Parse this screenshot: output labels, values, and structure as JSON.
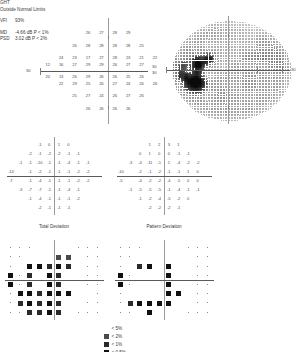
{
  "report": {
    "type": "humphrey-visual-field-single-field-analysis"
  },
  "sensitivity_plot": {
    "name": "numeric-sensitivity-grid",
    "axis_label_left": "30",
    "rows": [
      {
        "y": 3,
        "values": [
          null,
          null,
          null,
          26,
          27,
          28,
          29,
          null,
          null,
          null
        ]
      },
      {
        "y": 2,
        "values": [
          null,
          null,
          26,
          28,
          28,
          28,
          28,
          25,
          null,
          null
        ]
      },
      {
        "y": 1,
        "values": [
          null,
          24,
          23,
          17,
          27,
          28,
          23,
          21,
          22,
          null
        ]
      },
      {
        "y": 0.5,
        "values": [
          12,
          16,
          27,
          29,
          29,
          26,
          27,
          27,
          null,
          null
        ]
      },
      {
        "y": -0.5,
        "values": [
          20,
          13,
          26,
          29,
          26,
          26,
          25,
          26,
          null,
          null
        ]
      },
      {
        "y": -1,
        "values": [
          null,
          22,
          29,
          25,
          26,
          27,
          24,
          26,
          26,
          null
        ]
      },
      {
        "y": -2,
        "values": [
          null,
          null,
          25,
          27,
          24,
          26,
          27,
          26,
          null,
          null
        ]
      },
      {
        "y": -3,
        "values": [
          null,
          null,
          null,
          26,
          26,
          26,
          26,
          null,
          null,
          null
        ]
      }
    ]
  },
  "grayscale_plot": {
    "name": "grayscale-sensitivity-map",
    "label_left_top": "30",
    "label_left_bottom": "30",
    "label_right": "30"
  },
  "total_deviation_numeric": {
    "name": "total-deviation-numeric-grid",
    "caption": "Total Deviation",
    "rows": [
      {
        "values": [
          null,
          null,
          null,
          -1,
          0,
          1,
          0,
          null,
          null,
          null
        ]
      },
      {
        "values": [
          null,
          null,
          -2,
          -1,
          -2,
          -2,
          -1,
          -1,
          null,
          null
        ]
      },
      {
        "values": [
          null,
          -1,
          -1,
          -10,
          -1,
          -1,
          -4,
          -1,
          -1,
          null
        ]
      },
      {
        "values": [
          -14,
          null,
          -1,
          -2,
          -1,
          -1,
          -1,
          -2,
          -2,
          null
        ]
      },
      {
        "values": [
          -7,
          null,
          -1,
          -4,
          -1,
          -1,
          -1,
          -2,
          -2,
          null
        ]
      },
      {
        "values": [
          null,
          -3,
          -7,
          -7,
          -1,
          -1,
          -4,
          -1,
          null,
          null
        ]
      },
      {
        "values": [
          null,
          null,
          -1,
          -4,
          -1,
          -1,
          -1,
          -2,
          null,
          null
        ]
      },
      {
        "values": [
          null,
          null,
          null,
          -2,
          -1,
          -1,
          -1,
          null,
          null,
          null
        ]
      }
    ]
  },
  "pattern_deviation_numeric": {
    "name": "pattern-deviation-numeric-grid",
    "caption": "Pattern Deviation",
    "rows": [
      {
        "values": [
          null,
          null,
          null,
          1,
          2,
          3,
          1,
          null,
          null,
          null
        ]
      },
      {
        "values": [
          null,
          null,
          0,
          1,
          0,
          0,
          -1,
          -1,
          null,
          null
        ]
      },
      {
        "values": [
          null,
          -3,
          -4,
          -11,
          -1,
          1,
          -4,
          -2,
          -2,
          null
        ]
      },
      {
        "values": [
          -10,
          null,
          -2,
          -1,
          -2,
          -1,
          -1,
          1,
          0,
          null
        ]
      },
      {
        "values": [
          -5,
          null,
          -4,
          -2,
          -2,
          -4,
          -5,
          0,
          0,
          null
        ]
      },
      {
        "values": [
          null,
          -1,
          -5,
          -5,
          -5,
          -1,
          -4,
          -1,
          -1,
          null
        ]
      },
      {
        "values": [
          null,
          null,
          -1,
          -2,
          -4,
          -5,
          -2,
          0,
          null,
          null
        ]
      },
      {
        "values": [
          null,
          null,
          null,
          -2,
          -2,
          -2,
          -1,
          null,
          null,
          null
        ]
      }
    ]
  },
  "total_deviation_prob": {
    "name": "total-deviation-probability-plot",
    "rows": [
      {
        "levels": [
          0,
          0,
          0,
          1,
          1,
          1,
          1,
          0,
          0,
          0
        ]
      },
      {
        "levels": [
          0,
          0,
          1,
          1,
          1,
          2,
          2,
          1,
          0,
          0
        ]
      },
      {
        "levels": [
          0,
          1,
          4,
          4,
          3,
          4,
          3,
          1,
          0,
          0
        ]
      },
      {
        "levels": [
          4,
          0,
          3,
          1,
          4,
          3,
          1,
          1,
          0,
          0
        ]
      },
      {
        "levels": [
          4,
          0,
          3,
          1,
          4,
          3,
          1,
          1,
          0,
          0
        ]
      },
      {
        "levels": [
          0,
          4,
          4,
          3,
          4,
          4,
          4,
          1,
          1,
          0
        ]
      },
      {
        "levels": [
          0,
          3,
          4,
          3,
          4,
          3,
          1,
          1,
          0,
          0
        ]
      },
      {
        "levels": [
          0,
          0,
          3,
          3,
          4,
          3,
          1,
          0,
          0,
          0
        ]
      }
    ]
  },
  "pattern_deviation_prob": {
    "name": "pattern-deviation-probability-plot",
    "rows": [
      {
        "levels": [
          0,
          0,
          0,
          1,
          1,
          1,
          1,
          0,
          0,
          0
        ]
      },
      {
        "levels": [
          0,
          0,
          1,
          1,
          1,
          1,
          1,
          1,
          0,
          0
        ]
      },
      {
        "levels": [
          0,
          1,
          3,
          4,
          1,
          4,
          1,
          1,
          0,
          0
        ]
      },
      {
        "levels": [
          4,
          0,
          1,
          1,
          1,
          4,
          1,
          1,
          0,
          0
        ]
      },
      {
        "levels": [
          4,
          0,
          1,
          1,
          1,
          4,
          1,
          1,
          0,
          0
        ]
      },
      {
        "levels": [
          0,
          1,
          1,
          1,
          1,
          4,
          4,
          1,
          0,
          0
        ]
      },
      {
        "levels": [
          0,
          3,
          4,
          4,
          4,
          4,
          1,
          1,
          0,
          0
        ]
      },
      {
        "levels": [
          0,
          0,
          1,
          4,
          1,
          1,
          1,
          0,
          0,
          0
        ]
      }
    ]
  },
  "stats": {
    "ght_label": "GHT",
    "ght_value": "Outside Normal Limits",
    "vfi_label": "VFI",
    "vfi_value": "93%",
    "md_label": "MD",
    "md_value": "-4.66 dB  P < 1%",
    "psd_label": "PSD",
    "psd_value": "3.02 dB  P < 2%"
  },
  "legend": {
    "name": "probability-symbol-legend",
    "items": [
      {
        "level": 1,
        "label": "< 5%"
      },
      {
        "level": 2,
        "label": "< 2%"
      },
      {
        "level": 3,
        "label": "< 1%"
      },
      {
        "level": 4,
        "label": "< 0.5%"
      }
    ]
  },
  "colors": {
    "ink": "#3a3a3a",
    "grid": "#9a9a9a",
    "axis": "#5a5a5a",
    "defect_dark": "#101010"
  }
}
